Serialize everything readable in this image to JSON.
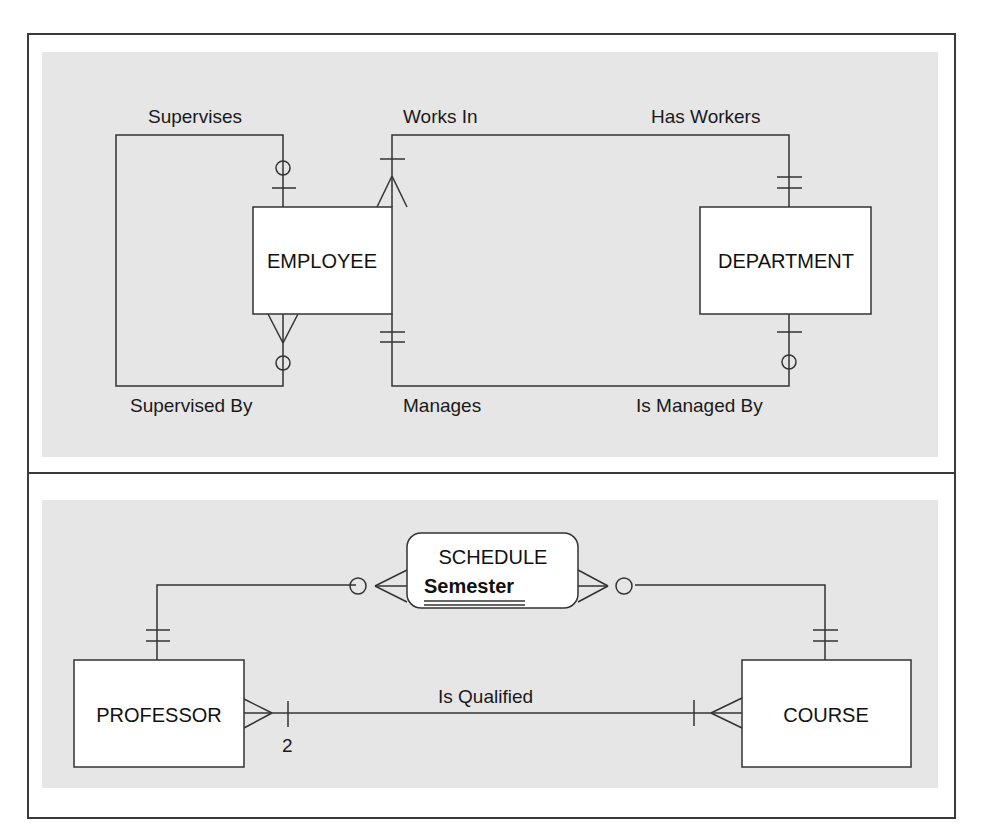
{
  "panels": {
    "top": {
      "entities": {
        "employee": "EMPLOYEE",
        "department": "DEPARTMENT"
      },
      "relationships": {
        "supervises": "Supervises",
        "supervised_by": "Supervised By",
        "works_in": "Works In",
        "has_workers": "Has Workers",
        "manages": "Manages",
        "is_managed_by": "Is Managed By"
      }
    },
    "bottom": {
      "entities": {
        "schedule": "SCHEDULE",
        "schedule_key": "Semester",
        "professor": "PROFESSOR",
        "course": "COURSE"
      },
      "relationships": {
        "is_qualified": "Is Qualified",
        "min_cardinality": "2"
      }
    }
  },
  "colors": {
    "line": "#333333",
    "shade": "#e6e6e6",
    "entity_fill": "#ffffff"
  }
}
